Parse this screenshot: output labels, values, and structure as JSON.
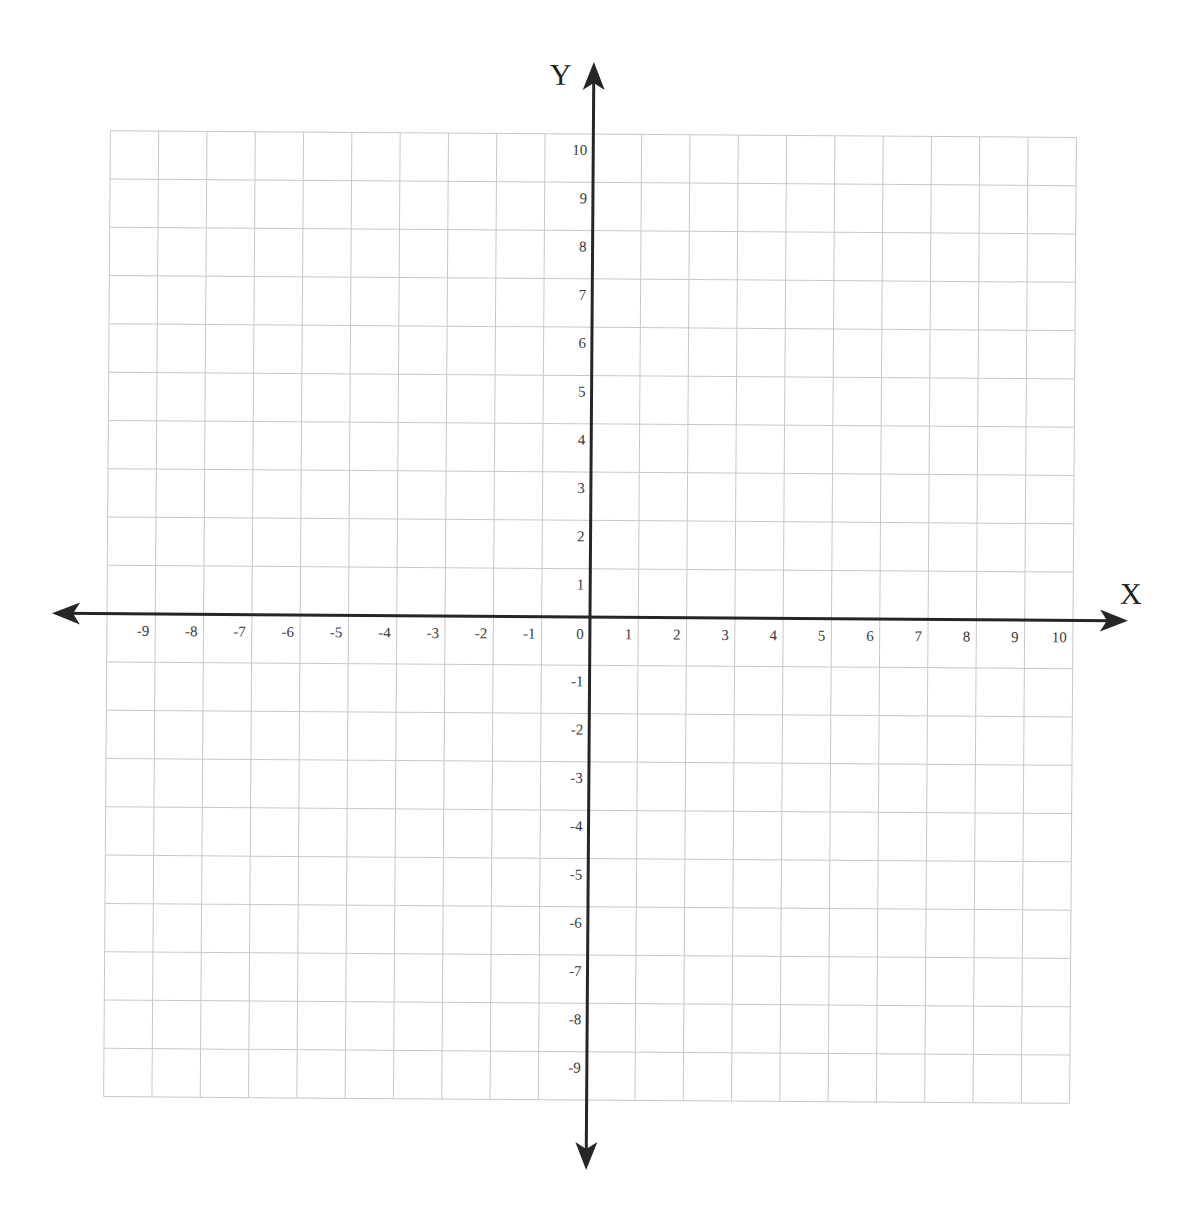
{
  "title_cut_off": "",
  "chart_data": {
    "type": "scatter",
    "title": "",
    "subtitle": "Blank coordinate plane (graph paper)",
    "xlabel": "X",
    "ylabel": "Y",
    "xlim": [
      -10,
      10
    ],
    "ylim": [
      -10,
      10
    ],
    "grid": true,
    "legend": null,
    "x_tick_labels": [
      "-9",
      "-8",
      "-7",
      "-6",
      "-5",
      "-4",
      "-3",
      "-2",
      "-1",
      "0",
      "1",
      "2",
      "3",
      "4",
      "5",
      "6",
      "7",
      "8",
      "9",
      "10"
    ],
    "y_tick_labels": [
      "10",
      "9",
      "8",
      "7",
      "6",
      "5",
      "4",
      "3",
      "2",
      "1",
      "-1",
      "-2",
      "-3",
      "-4",
      "-5",
      "-6",
      "-7",
      "-8",
      "-9"
    ],
    "series": [],
    "axis_arrows": {
      "x": "both-ends",
      "y": "both-ends"
    }
  },
  "style": {
    "grid_color": "#c8c8c8",
    "axis_color": "#262626",
    "label_color": "#3a3a3a",
    "background": "#ffffff"
  }
}
